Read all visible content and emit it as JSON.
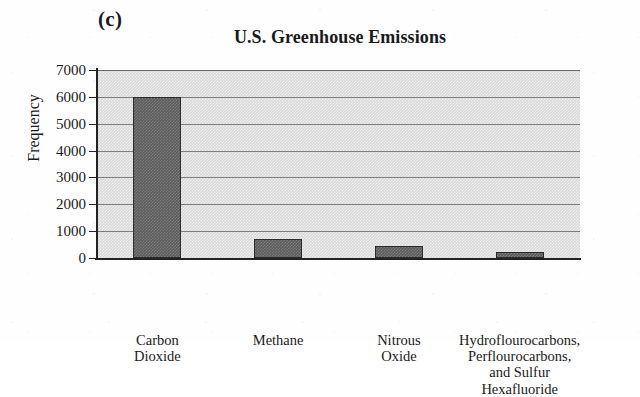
{
  "panel_letter": "(c)",
  "chart_data": {
    "type": "bar",
    "title": "U.S. Greenhouse Emissions",
    "xlabel": "",
    "ylabel": "Frequency",
    "ylim": [
      0,
      7000
    ],
    "ytick_step": 1000,
    "yticks": [
      "7000",
      "6000",
      "5000",
      "4000",
      "3000",
      "2000",
      "1000",
      "0"
    ],
    "grid": true,
    "legend": false,
    "categories": [
      "Carbon Dioxide",
      "Methane",
      "Nitrous Oxide",
      "Hydroflourocarbons, Perflourocarbons, and Sulfur Hexafluoride"
    ],
    "category_lines": [
      [
        "Carbon",
        "Dioxide"
      ],
      [
        "Methane"
      ],
      [
        "Nitrous",
        "Oxide"
      ],
      [
        "Hydroflourocarbons,",
        "Perflourocarbons,",
        "and Sulfur",
        "Hexafluoride"
      ]
    ],
    "values": [
      6000,
      690,
      460,
      230
    ],
    "colors": {
      "bar_fill": "#5c5c5c",
      "bar_edge": "#2b2b2b",
      "plot_background": "#d9d9d9",
      "gridline": "#7d7d7d",
      "axis": "#232323",
      "text": "#1a1a1a",
      "page_background": "#fefefe"
    }
  }
}
